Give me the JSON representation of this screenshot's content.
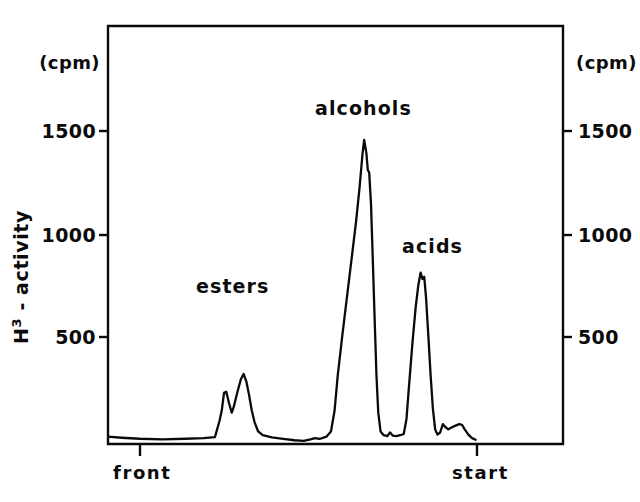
{
  "chart_data": {
    "type": "line",
    "title": "",
    "subtitle": "",
    "xlabel": "",
    "ylabel": "H3 - activity",
    "ylabel_base": "H",
    "ylabel_sup": "3",
    "ylabel_rest": " - activity",
    "y_unit": "(cpm)",
    "y_unit_right": "(cpm)",
    "ylim": [
      0,
      2000
    ],
    "yticks": [
      500,
      1000,
      1500
    ],
    "ytick_labels": [
      "500",
      "1000",
      "1500"
    ],
    "ytick_labels_right": [
      "500",
      "1000",
      "1500"
    ],
    "xlim": [
      0,
      100
    ],
    "xticks": [
      7,
      81
    ],
    "xtick_labels": [
      "front",
      "start"
    ],
    "grid": false,
    "legend": false,
    "legend_position": "none",
    "annotations": [
      {
        "text": "esters",
        "x": 28,
        "y": 760
      },
      {
        "text": "alcohols",
        "x": 56,
        "y": 1620
      },
      {
        "text": "acids",
        "x": 71,
        "y": 950
      }
    ],
    "series": [
      {
        "name": "H3-activity chromatogram",
        "color": "#0a0a0a",
        "points": [
          [
            0.0,
            35
          ],
          [
            3.0,
            30
          ],
          [
            7.0,
            25
          ],
          [
            12.0,
            22
          ],
          [
            17.0,
            25
          ],
          [
            21.0,
            28
          ],
          [
            23.5,
            33
          ],
          [
            24.5,
            110
          ],
          [
            25.0,
            160
          ],
          [
            25.5,
            245
          ],
          [
            26.0,
            250
          ],
          [
            26.6,
            195
          ],
          [
            27.2,
            150
          ],
          [
            27.6,
            175
          ],
          [
            28.4,
            245
          ],
          [
            29.2,
            310
          ],
          [
            29.8,
            335
          ],
          [
            30.4,
            300
          ],
          [
            31.0,
            235
          ],
          [
            31.6,
            160
          ],
          [
            32.2,
            105
          ],
          [
            33.0,
            60
          ],
          [
            34.0,
            42
          ],
          [
            36.0,
            32
          ],
          [
            38.5,
            25
          ],
          [
            41.0,
            18
          ],
          [
            43.0,
            15
          ],
          [
            44.5,
            22
          ],
          [
            45.5,
            28
          ],
          [
            46.5,
            24
          ],
          [
            48.0,
            35
          ],
          [
            49.0,
            60
          ],
          [
            49.8,
            160
          ],
          [
            50.5,
            330
          ],
          [
            51.5,
            520
          ],
          [
            52.5,
            700
          ],
          [
            53.5,
            880
          ],
          [
            54.5,
            1060
          ],
          [
            55.3,
            1230
          ],
          [
            55.9,
            1380
          ],
          [
            56.3,
            1455
          ],
          [
            56.8,
            1390
          ],
          [
            57.1,
            1310
          ],
          [
            57.4,
            1300
          ],
          [
            57.8,
            1150
          ],
          [
            58.2,
            880
          ],
          [
            58.6,
            600
          ],
          [
            59.0,
            330
          ],
          [
            59.4,
            150
          ],
          [
            59.9,
            60
          ],
          [
            60.6,
            42
          ],
          [
            61.4,
            38
          ],
          [
            62.0,
            55
          ],
          [
            62.6,
            40
          ],
          [
            63.4,
            38
          ],
          [
            64.2,
            42
          ],
          [
            65.0,
            48
          ],
          [
            65.6,
            120
          ],
          [
            66.2,
            290
          ],
          [
            66.9,
            480
          ],
          [
            67.6,
            650
          ],
          [
            68.2,
            760
          ],
          [
            68.7,
            820
          ],
          [
            69.1,
            790
          ],
          [
            69.5,
            800
          ],
          [
            69.9,
            700
          ],
          [
            70.4,
            520
          ],
          [
            70.9,
            330
          ],
          [
            71.4,
            170
          ],
          [
            71.9,
            70
          ],
          [
            72.4,
            45
          ],
          [
            73.0,
            55
          ],
          [
            73.6,
            95
          ],
          [
            74.2,
            80
          ],
          [
            74.8,
            70
          ],
          [
            75.6,
            80
          ],
          [
            76.4,
            88
          ],
          [
            77.2,
            95
          ],
          [
            77.8,
            92
          ],
          [
            78.4,
            70
          ],
          [
            79.2,
            45
          ],
          [
            80.0,
            28
          ],
          [
            80.8,
            20
          ]
        ]
      }
    ]
  },
  "axes": {
    "box_color": "#0a0a0a",
    "line_color": "#0a0a0a"
  }
}
